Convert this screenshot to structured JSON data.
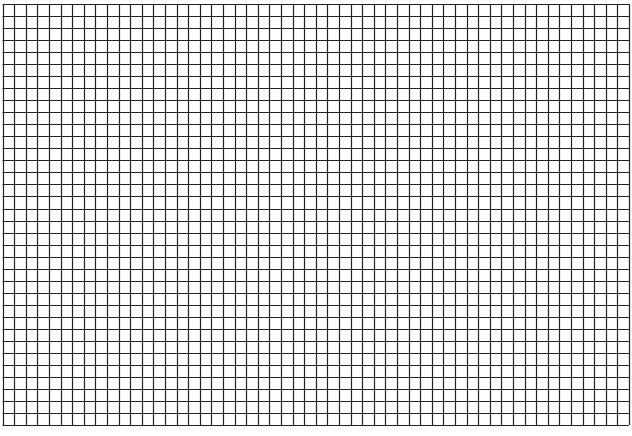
{
  "sheet": {
    "type": "grid-paper",
    "columns": 54,
    "rows": 35,
    "origin": [
      2.5,
      4
    ],
    "cell_width": 11.6,
    "cell_height": 12.03,
    "line_color": "#222222",
    "background_color": "#ffffff"
  }
}
